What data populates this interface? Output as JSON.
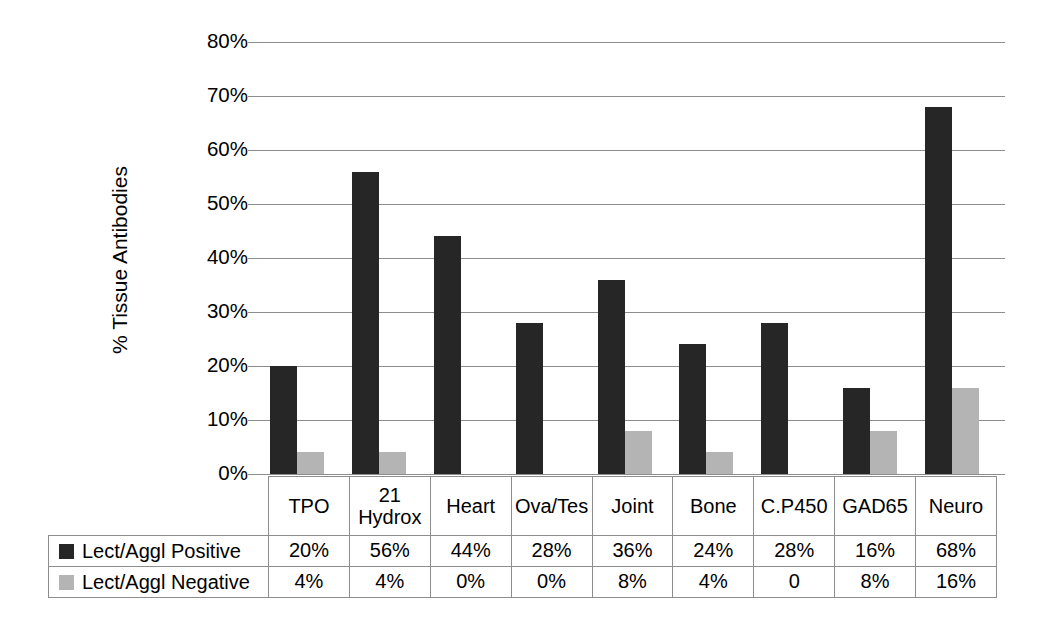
{
  "chart_data": {
    "type": "bar",
    "title": "",
    "subtitle": "",
    "xlabel": "",
    "ylabel": "% Tissue Antibodies",
    "ylim": [
      0,
      80
    ],
    "ytick_step": 10,
    "grid": true,
    "legend_position": "data-table-left",
    "categories": [
      "TPO",
      "21 Hydrox",
      "Heart",
      "Ova/Tes",
      "Joint",
      "Bone",
      "C.P450",
      "GAD65",
      "Neuro"
    ],
    "category_lines": [
      [
        "TPO"
      ],
      [
        "21",
        "Hydrox"
      ],
      [
        "Heart"
      ],
      [
        "Ova/Tes"
      ],
      [
        "Joint"
      ],
      [
        "Bone"
      ],
      [
        "C.P450"
      ],
      [
        "GAD65"
      ],
      [
        "Neuro"
      ]
    ],
    "series": [
      {
        "name": "Lect/Aggl Positive",
        "color": "#262626",
        "values": [
          20,
          56,
          44,
          28,
          36,
          24,
          28,
          16,
          68
        ],
        "labels": [
          "20%",
          "56%",
          "44%",
          "28%",
          "36%",
          "24%",
          "28%",
          "16%",
          "68%"
        ]
      },
      {
        "name": "Lect/Aggl Negative",
        "color": "#b4b4b4",
        "values": [
          4,
          4,
          0,
          0,
          8,
          4,
          0,
          8,
          16
        ],
        "labels": [
          "4%",
          "4%",
          "0%",
          "0%",
          "8%",
          "4%",
          "0",
          "8%",
          "16%"
        ]
      }
    ],
    "ytick_labels": [
      "0%",
      "10%",
      "20%",
      "30%",
      "40%",
      "50%",
      "60%",
      "70%",
      "80%"
    ],
    "ytick_values": [
      0,
      10,
      20,
      30,
      40,
      50,
      60,
      70,
      80
    ]
  },
  "colors": {
    "positive": "#262626",
    "negative": "#b4b4b4",
    "gridline": "#8d8d8d",
    "border": "#8d8d8d",
    "background": "#ffffff",
    "text": "#000000"
  },
  "axis": {
    "y_title": "% Tissue Antibodies",
    "ticks": [
      {
        "label": "80%",
        "value": 80
      },
      {
        "label": "70%",
        "value": 70
      },
      {
        "label": "60%",
        "value": 60
      },
      {
        "label": "50%",
        "value": 50
      },
      {
        "label": "40%",
        "value": 40
      },
      {
        "label": "30%",
        "value": 30
      },
      {
        "label": "20%",
        "value": 20
      },
      {
        "label": "10%",
        "value": 10
      },
      {
        "label": "0%",
        "value": 0
      }
    ]
  },
  "table": {
    "header": {
      "corner": "",
      "columns": [
        {
          "line1": "TPO",
          "line2": ""
        },
        {
          "line1": "21",
          "line2": "Hydrox"
        },
        {
          "line1": "Heart",
          "line2": ""
        },
        {
          "line1": "Ova/Tes",
          "line2": ""
        },
        {
          "line1": "Joint",
          "line2": ""
        },
        {
          "line1": "Bone",
          "line2": ""
        },
        {
          "line1": "C.P450",
          "line2": ""
        },
        {
          "line1": "GAD65",
          "line2": ""
        },
        {
          "line1": "Neuro",
          "line2": ""
        }
      ]
    },
    "rows": [
      {
        "label": "Lect/Aggl Positive",
        "swatch": "positive-swatch",
        "cells": [
          "20%",
          "56%",
          "44%",
          "28%",
          "36%",
          "24%",
          "28%",
          "16%",
          "68%"
        ]
      },
      {
        "label": "Lect/Aggl Negative",
        "swatch": "negative-swatch",
        "cells": [
          "4%",
          "4%",
          "0%",
          "0%",
          "8%",
          "4%",
          "0",
          "8%",
          "16%"
        ]
      }
    ]
  }
}
